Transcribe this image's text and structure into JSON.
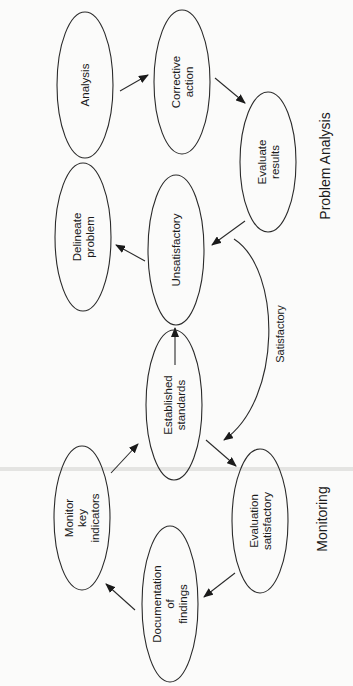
{
  "diagram": {
    "orientation": "rotated-90-ccw",
    "stroke_color": "#2a2a2a",
    "background": "#fbfbfa",
    "sections": [
      {
        "id": "problem-analysis",
        "label": "Problem Analysis",
        "x": 325,
        "y": 166
      },
      {
        "id": "monitoring",
        "label": "Monitoring",
        "x": 322,
        "y": 519
      }
    ],
    "nodes": [
      {
        "id": "analysis",
        "lines": [
          "Analysis"
        ],
        "cx": 85,
        "cy": 85,
        "rx": 28,
        "ry": 73
      },
      {
        "id": "corrective-action",
        "lines": [
          "Corrective",
          "action"
        ],
        "cx": 182,
        "cy": 82,
        "rx": 28,
        "ry": 72
      },
      {
        "id": "evaluate-results",
        "lines": [
          "Evaluate",
          "results"
        ],
        "cx": 268,
        "cy": 162,
        "rx": 28,
        "ry": 70
      },
      {
        "id": "delineate-problem",
        "lines": [
          "Delineate",
          "problem"
        ],
        "cx": 83,
        "cy": 237,
        "rx": 28,
        "ry": 74
      },
      {
        "id": "unsatisfactory",
        "lines": [
          "Unsatisfactory"
        ],
        "cx": 176,
        "cy": 250,
        "rx": 28,
        "ry": 75
      },
      {
        "id": "established-standards",
        "lines": [
          "Established",
          "standards"
        ],
        "cx": 174,
        "cy": 405,
        "rx": 28,
        "ry": 75
      },
      {
        "id": "monitor-key-indicators",
        "lines": [
          "Monitor",
          "key",
          "indicators"
        ],
        "cx": 82,
        "cy": 518,
        "rx": 28,
        "ry": 72
      },
      {
        "id": "evaluation-satisfactory",
        "lines": [
          "Evaluation",
          "satisfactory"
        ],
        "cx": 260,
        "cy": 521,
        "rx": 28,
        "ry": 72
      },
      {
        "id": "documentation-of-findings",
        "lines": [
          "Documentation",
          "of",
          "findings"
        ],
        "cx": 170,
        "cy": 604,
        "rx": 28,
        "ry": 78
      }
    ],
    "edges": [
      {
        "from": "analysis",
        "to": "corrective-action",
        "x1": 120,
        "y1": 91,
        "x2": 148,
        "y2": 75
      },
      {
        "from": "corrective-action",
        "to": "evaluate-results",
        "x1": 215,
        "y1": 78,
        "x2": 245,
        "y2": 103
      },
      {
        "from": "evaluate-results",
        "to": "unsatisfactory",
        "x1": 245,
        "y1": 221,
        "x2": 212,
        "y2": 245
      },
      {
        "from": "unsatisfactory",
        "to": "delineate-problem",
        "x1": 145,
        "y1": 261,
        "x2": 116,
        "y2": 245
      },
      {
        "from": "established-standards",
        "to": "unsatisfactory",
        "x1": 175,
        "y1": 365,
        "x2": 175,
        "y2": 328
      },
      {
        "from": "established-standards",
        "to": "evaluation-satisfactory",
        "x1": 206,
        "y1": 440,
        "x2": 236,
        "y2": 466
      },
      {
        "from": "evaluation-satisfactory",
        "to": "documentation-of-findings",
        "x1": 235,
        "y1": 573,
        "x2": 204,
        "y2": 597
      },
      {
        "from": "documentation-of-findings",
        "to": "monitor-key-indicators",
        "x1": 135,
        "y1": 610,
        "x2": 106,
        "y2": 584
      },
      {
        "from": "monitor-key-indicators",
        "to": "established-standards",
        "x1": 111,
        "y1": 473,
        "x2": 138,
        "y2": 444
      }
    ],
    "curved_edge": {
      "from": "unsatisfactory",
      "to": "established-standards",
      "label": "Satisfactory",
      "label_x": 280,
      "label_y": 334,
      "path": "M 234 239 C 282 270, 282 400, 224 440"
    }
  }
}
